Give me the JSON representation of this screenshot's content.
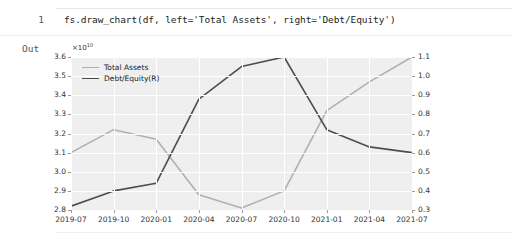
{
  "notebook": {
    "cell_number": "1",
    "code": "fs.draw_chart(df, left='Total Assets', right='Debt/Equity')",
    "out_label": "Out"
  },
  "chart_data": {
    "type": "line",
    "title": "",
    "xlabel": "",
    "ylabel": "",
    "exponent_label": "×10",
    "exponent_power": "10",
    "grid": true,
    "legend_position": "upper left",
    "plot_background": "#efefef",
    "categories": [
      "2019-07",
      "2019-10",
      "2020-01",
      "2020-04",
      "2020-07",
      "2020-10",
      "2021-01",
      "2021-04",
      "2021-07"
    ],
    "left_axis": {
      "label": "Total Assets",
      "ticks": [
        "3.6",
        "3.5",
        "3.4",
        "3.3",
        "3.2",
        "3.1",
        "3.0",
        "2.9",
        "2.8"
      ],
      "tick_values": [
        3.6,
        3.5,
        3.4,
        3.3,
        3.2,
        3.1,
        3.0,
        2.9,
        2.8
      ],
      "ylim": [
        2.8,
        3.6
      ],
      "scale_exponent": 10
    },
    "right_axis": {
      "label": "Debt/Equity(R)",
      "ticks": [
        "1.1",
        "1.0",
        "0.9",
        "0.8",
        "0.7",
        "0.6",
        "0.5",
        "0.4",
        "0.3"
      ],
      "tick_values": [
        1.1,
        1.0,
        0.9,
        0.8,
        0.7,
        0.6,
        0.5,
        0.4,
        0.3
      ],
      "ylim": [
        0.3,
        1.1
      ]
    },
    "series": [
      {
        "name": "Total Assets",
        "axis": "left",
        "color": "#b0b0b0",
        "values": [
          3.1,
          3.22,
          3.17,
          2.88,
          2.81,
          2.9,
          3.32,
          3.47,
          3.6
        ]
      },
      {
        "name": "Debt/Equity(R)",
        "axis": "right",
        "color": "#4d4d4d",
        "values": [
          0.32,
          0.4,
          0.44,
          0.88,
          1.05,
          1.1,
          0.72,
          0.63,
          0.6
        ]
      }
    ]
  }
}
